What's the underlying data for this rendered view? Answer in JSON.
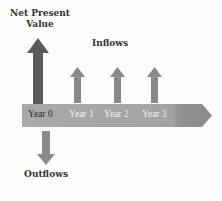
{
  "diagram": {
    "npv_label": "Net Present Value",
    "npv_label_line1": "Net Present",
    "npv_label_line2": "Value",
    "inflows_label": "Inflows",
    "outflows_label": "Outflows",
    "timeline": {
      "years": [
        "Year 0",
        "Year 1",
        "Year 2",
        "Year 3"
      ]
    },
    "colors": {
      "npv_arrow": "#5a5a5a",
      "inflow_arrow": "#8a8a8a",
      "outflow_arrow": "#8a8a8a",
      "timeline_bar": "#a6a6a6",
      "timeline_tip": "#8f8f8f",
      "year0_text": "#2a2a2a",
      "year_text": "#f2f2f2"
    }
  }
}
